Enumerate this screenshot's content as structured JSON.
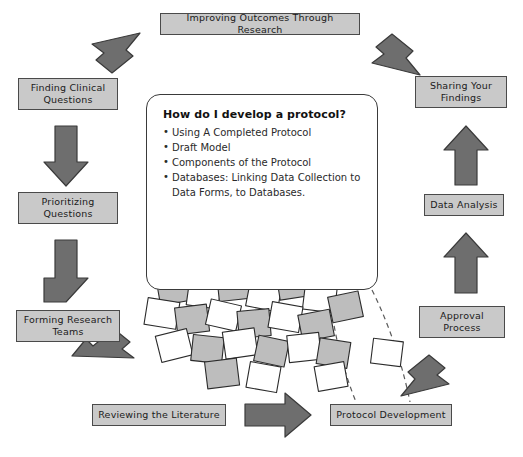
{
  "diagram": {
    "type": "cycle-flowchart",
    "title": "Improving Outcomes Through Research",
    "palette": {
      "box_fill": "#c9c9c9",
      "box_border": "#4a4a4a",
      "arrow_fill": "#6e6e6e",
      "arrow_border": "#3a3a3a",
      "background": "#ffffff",
      "text": "#1b1b1b"
    },
    "nodes": [
      {
        "id": "improving-outcomes",
        "label": "Improving Outcomes Through Research"
      },
      {
        "id": "finding-clinical",
        "label": "Finding Clinical Questions"
      },
      {
        "id": "prioritizing",
        "label": "Prioritizing Questions"
      },
      {
        "id": "forming-teams",
        "label": "Forming Research Teams"
      },
      {
        "id": "reviewing-literature",
        "label": "Reviewing the Literature"
      },
      {
        "id": "protocol-development",
        "label": "Protocol Development"
      },
      {
        "id": "approval-process",
        "label": "Approval Process"
      },
      {
        "id": "data-analysis",
        "label": "Data Analysis"
      },
      {
        "id": "sharing-findings",
        "label": "Sharing Your Findings"
      }
    ],
    "edges": [
      {
        "from": "improving-outcomes",
        "to": "finding-clinical",
        "style": "solid",
        "shape": "diagonal-down-left"
      },
      {
        "from": "finding-clinical",
        "to": "prioritizing",
        "style": "solid",
        "shape": "down"
      },
      {
        "from": "prioritizing",
        "to": "forming-teams",
        "style": "solid",
        "shape": "down"
      },
      {
        "from": "forming-teams",
        "to": "reviewing-literature",
        "style": "solid",
        "shape": "diagonal-down-right"
      },
      {
        "from": "reviewing-literature",
        "to": "protocol-development",
        "style": "solid",
        "shape": "right"
      },
      {
        "from": "protocol-development",
        "to": "approval-process",
        "style": "solid",
        "shape": "diagonal-up-right"
      },
      {
        "from": "approval-process",
        "to": "data-analysis",
        "style": "solid",
        "shape": "up"
      },
      {
        "from": "data-analysis",
        "to": "sharing-findings",
        "style": "solid",
        "shape": "up"
      },
      {
        "from": "sharing-findings",
        "to": "improving-outcomes",
        "style": "solid",
        "shape": "diagonal-up-left"
      }
    ]
  },
  "callout": {
    "heading": "How do I develop a protocol?",
    "items": [
      "Using A Completed Protocol",
      "Draft Model",
      "Components of the Protocol",
      "Databases: Linking Data Collection to Data Forms, to Databases."
    ]
  },
  "illustration": {
    "name": "man-buried-in-papers",
    "description": "Cartoon man with raised arm surrounded by scattered sheets of paper"
  }
}
